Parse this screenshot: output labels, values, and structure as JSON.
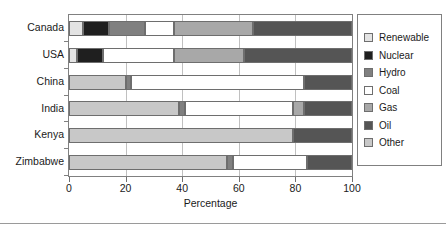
{
  "chart_data": {
    "type": "bar",
    "orientation": "horizontal",
    "stacked": true,
    "title": "",
    "xlabel": "Percentage",
    "ylabel": "",
    "xlim": [
      0,
      100
    ],
    "xticks": [
      0,
      20,
      40,
      60,
      80,
      100
    ],
    "xtick_labels": [
      "0",
      "20",
      "40",
      "60",
      "80",
      "100"
    ],
    "grid": true,
    "grid_axis": "x",
    "legend_position": "right",
    "categories": [
      "Canada",
      "USA",
      "China",
      "India",
      "Kenya",
      "Zimbabwe"
    ],
    "series": [
      {
        "name": "Renewable",
        "color": "#e3e3e3",
        "values": [
          5,
          3,
          0,
          0,
          0,
          0
        ]
      },
      {
        "name": "Nuclear",
        "color": "#1f1f1f",
        "values": [
          9,
          9,
          0,
          0,
          0,
          0
        ]
      },
      {
        "name": "Hydro",
        "color": "#808080",
        "values": [
          13,
          0,
          2,
          2,
          0,
          2
        ]
      },
      {
        "name": "Coal",
        "color": "#ffffff",
        "values": [
          10,
          25,
          61,
          38,
          0,
          26
        ]
      },
      {
        "name": "Gas",
        "color": "#a8a8a8",
        "values": [
          28,
          25,
          0,
          4,
          0,
          0
        ]
      },
      {
        "name": "Oil",
        "color": "#555555",
        "values": [
          35,
          38,
          17,
          17,
          21,
          16
        ]
      },
      {
        "name": "Other",
        "color": "#c8c8c8",
        "values": [
          0,
          0,
          20,
          39,
          79,
          56
        ]
      }
    ],
    "stack_order": [
      "Other",
      "Hydro",
      "Coal",
      "Gas",
      "Oil"
    ],
    "bars": [
      {
        "category": "Canada",
        "segments": [
          {
            "series": "Renewable",
            "start": 0,
            "end": 5,
            "value": 5
          },
          {
            "series": "Nuclear",
            "start": 5,
            "end": 14,
            "value": 9
          },
          {
            "series": "Hydro",
            "start": 14,
            "end": 27,
            "value": 13
          },
          {
            "series": "Coal",
            "start": 27,
            "end": 37,
            "value": 10
          },
          {
            "series": "Gas",
            "start": 37,
            "end": 65,
            "value": 28
          },
          {
            "series": "Oil",
            "start": 65,
            "end": 100,
            "value": 35
          }
        ]
      },
      {
        "category": "USA",
        "segments": [
          {
            "series": "Renewable",
            "start": 0,
            "end": 3,
            "value": 3
          },
          {
            "series": "Nuclear",
            "start": 3,
            "end": 12,
            "value": 9
          },
          {
            "series": "Coal",
            "start": 12,
            "end": 37,
            "value": 25
          },
          {
            "series": "Gas",
            "start": 37,
            "end": 62,
            "value": 25
          },
          {
            "series": "Oil",
            "start": 62,
            "end": 100,
            "value": 38
          }
        ]
      },
      {
        "category": "China",
        "segments": [
          {
            "series": "Other",
            "start": 0,
            "end": 20,
            "value": 20
          },
          {
            "series": "Hydro",
            "start": 20,
            "end": 22,
            "value": 2
          },
          {
            "series": "Coal",
            "start": 22,
            "end": 83,
            "value": 61
          },
          {
            "series": "Oil",
            "start": 83,
            "end": 100,
            "value": 17
          }
        ]
      },
      {
        "category": "India",
        "segments": [
          {
            "series": "Other",
            "start": 0,
            "end": 39,
            "value": 39
          },
          {
            "series": "Hydro",
            "start": 39,
            "end": 41,
            "value": 2
          },
          {
            "series": "Coal",
            "start": 41,
            "end": 79,
            "value": 38
          },
          {
            "series": "Gas",
            "start": 79,
            "end": 83,
            "value": 4
          },
          {
            "series": "Oil",
            "start": 83,
            "end": 100,
            "value": 17
          }
        ]
      },
      {
        "category": "Kenya",
        "segments": [
          {
            "series": "Other",
            "start": 0,
            "end": 79,
            "value": 79
          },
          {
            "series": "Oil",
            "start": 79,
            "end": 100,
            "value": 21
          }
        ]
      },
      {
        "category": "Zimbabwe",
        "segments": [
          {
            "series": "Other",
            "start": 0,
            "end": 56,
            "value": 56
          },
          {
            "series": "Hydro",
            "start": 56,
            "end": 58,
            "value": 2
          },
          {
            "series": "Coal",
            "start": 58,
            "end": 84,
            "value": 26
          },
          {
            "series": "Oil",
            "start": 84,
            "end": 100,
            "value": 16
          }
        ]
      }
    ],
    "legend": [
      {
        "label": "Renewable",
        "color": "#e3e3e3"
      },
      {
        "label": "Nuclear",
        "color": "#1f1f1f"
      },
      {
        "label": "Hydro",
        "color": "#808080"
      },
      {
        "label": "Coal",
        "color": "#ffffff"
      },
      {
        "label": "Gas",
        "color": "#a8a8a8"
      },
      {
        "label": "Oil",
        "color": "#555555"
      },
      {
        "label": "Other",
        "color": "#c8c8c8"
      }
    ]
  }
}
